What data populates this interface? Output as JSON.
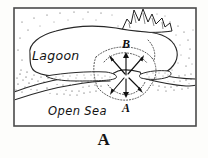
{
  "figure": {
    "caption": "A",
    "caption_position": "below-frame",
    "frame": {
      "x": 14,
      "y": 8,
      "width": 182,
      "height": 118,
      "border_color": "#4a4a4a",
      "background_color": "#ffffff"
    },
    "background_color": "#fdfdfb",
    "ink_color": "#1a1a1a",
    "style": "hand-drawn pen-and-ink line diagram with stippling"
  },
  "labels": {
    "lagoon": {
      "text": "Lagoon",
      "x": 32,
      "y": 60,
      "style": "handwritten-italic"
    },
    "open_sea": {
      "text": "Open Sea",
      "x": 48,
      "y": 115,
      "style": "handwritten-italic"
    },
    "point_b": {
      "text": "B",
      "x": 126,
      "y": 48,
      "style": "italic-serif"
    },
    "point_a": {
      "text": "A",
      "x": 126,
      "y": 110,
      "style": "italic-serif"
    }
  },
  "features": {
    "lagoon_water": "enclosed lagoon basin, upper-left of frame",
    "barrier_bar": "stippled sand barrier separating lagoon from open sea",
    "tidal_inlet": "gap in barrier at center with two converging spits",
    "flood_tidal_delta": "radiating current arrows spreading from inlet throat",
    "rocky_headland": "jagged rocky outcrop at top of frame",
    "open_sea_water": "open sea area below the barrier bar"
  },
  "arrows": {
    "count": 6,
    "description": "six arrows radiating outward from the inlet throat",
    "color": "#111111",
    "directions": [
      "up-left",
      "up",
      "up-right",
      "down-left",
      "down",
      "down-right"
    ]
  },
  "colors": {
    "ink": "#1a1a1a",
    "frame": "#4a4a4a",
    "stipple": "#2e2e2e",
    "paper": "#ffffff",
    "page": "#fdfdfb"
  }
}
